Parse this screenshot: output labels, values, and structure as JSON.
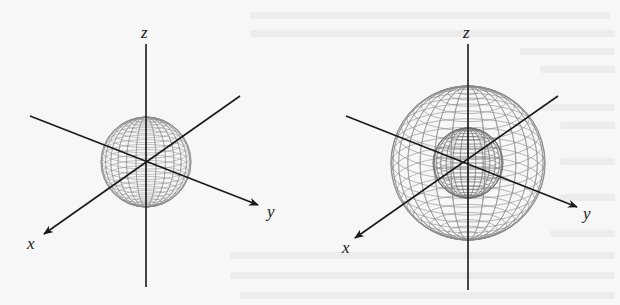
{
  "figures": [
    {
      "id": "left",
      "description": "small sphere centered at origin",
      "center": [
        146,
        162
      ],
      "spheres": [
        {
          "r": 45,
          "kind": "single"
        }
      ],
      "axes": {
        "z_label": "z",
        "x_label": "x",
        "y_label": "y"
      }
    },
    {
      "id": "right",
      "description": "large sphere enclosing smaller concentric sphere",
      "center": [
        468,
        163
      ],
      "spheres": [
        {
          "r": 77,
          "kind": "outer"
        },
        {
          "r": 35,
          "kind": "inner"
        }
      ],
      "axes": {
        "z_label": "z",
        "x_label": "x",
        "y_label": "y"
      }
    }
  ],
  "colors": {
    "background": "#f7f7f7",
    "axis": "#1a1a1a",
    "mesh": "#8a8a8a",
    "inner_mesh": "#6f6f6f"
  }
}
